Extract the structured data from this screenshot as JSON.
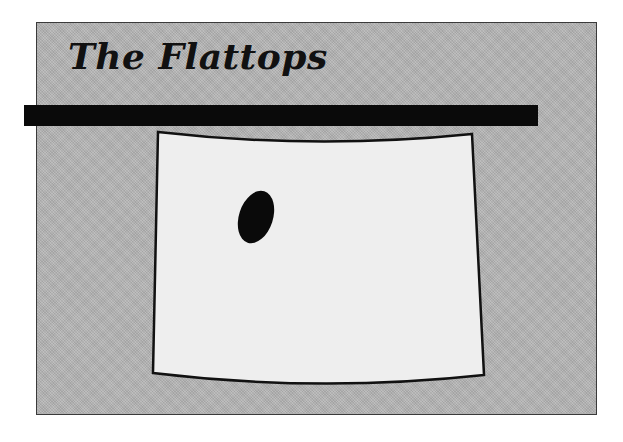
{
  "title": "The Flattops",
  "map": {
    "region": "state-outline",
    "marker": "location-blob",
    "colors": {
      "frame_background": "#b4b4b4",
      "state_fill": "#eeeeee",
      "outline": "#111111",
      "marker": "#0a0a0a",
      "title_bar": "#0a0a0a"
    }
  }
}
